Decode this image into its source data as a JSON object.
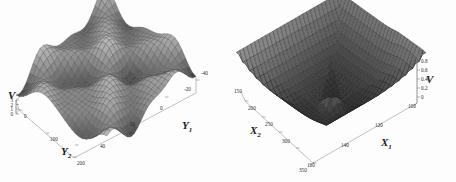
{
  "figure": {
    "background_color": "#fdfdfd",
    "frame_color": "#8d8d8d",
    "panel_count": 2
  },
  "chart_data": [
    {
      "type": "surface",
      "id": "left-surface-plot",
      "title": "",
      "xlabel": "Y1",
      "ylabel": "Y2",
      "zlabel": "V",
      "x_label_text": "Y",
      "x_label_sub": "1",
      "y_label_text": "Y",
      "y_label_sub": "2",
      "z_label_text": "V",
      "xticks": [
        "-40",
        "-20",
        "0",
        "20",
        "40"
      ],
      "xtick_values": [
        -40,
        -20,
        0,
        20,
        40
      ],
      "yticks": [
        "0",
        "100",
        "200"
      ],
      "ytick_values": [
        0,
        100,
        200
      ],
      "zticks": [
        "0",
        "1",
        "2",
        "3"
      ],
      "ztick_values": [
        0,
        1,
        2,
        3
      ],
      "xlim": [
        -50,
        50
      ],
      "ylim": [
        0,
        250
      ],
      "zlim": [
        0,
        3
      ],
      "grid": true,
      "mesh": true,
      "surface_style": "wireframe-shaded",
      "description": "Oscillatory egg-carton potential surface with multiple peaks and valleys",
      "mesh_rows": 26,
      "mesh_cols": 26,
      "legend": "none",
      "colors": {
        "mesh_light": "#b8b8b8",
        "mesh_dark": "#2a2a2a",
        "frame": "#8d8d8d"
      }
    },
    {
      "type": "surface",
      "id": "right-surface-plot",
      "title": "",
      "xlabel": "X1",
      "ylabel": "X2",
      "zlabel": "V",
      "x_label_text": "X",
      "x_label_sub": "1",
      "y_label_text": "X",
      "y_label_sub": "2",
      "z_label_text": "V",
      "xticks": [
        "100",
        "120",
        "140",
        "160"
      ],
      "xtick_values": [
        100,
        120,
        140,
        160
      ],
      "yticks": [
        "150",
        "200",
        "250",
        "300",
        "350"
      ],
      "ytick_values": [
        150,
        200,
        250,
        300,
        350
      ],
      "zticks": [
        "0",
        "0.2",
        "0.4",
        "0.6",
        "0.8",
        "1"
      ],
      "ztick_values": [
        0,
        0.2,
        0.4,
        0.6,
        0.8,
        1
      ],
      "xlim": [
        95,
        170
      ],
      "ylim": [
        140,
        360
      ],
      "zlim": [
        0,
        1
      ],
      "grid": true,
      "mesh": true,
      "surface_style": "wireframe-shaded",
      "description": "Dark basin surface with raised rim and a narrow central spike singularity",
      "mesh_rows": 28,
      "mesh_cols": 28,
      "legend": "none",
      "colors": {
        "mesh_light": "#9a9a9a",
        "mesh_dark": "#151515",
        "frame": "#8d8d8d"
      }
    }
  ]
}
